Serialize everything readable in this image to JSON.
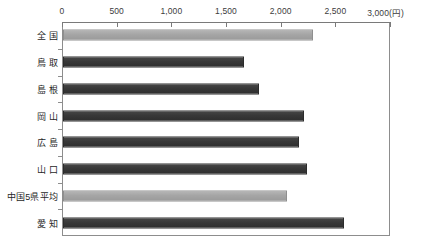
{
  "chart_data": {
    "type": "bar",
    "orientation": "horizontal",
    "title": "",
    "xlabel": "(円)",
    "ylabel": "",
    "unit": "円",
    "xlim": [
      0,
      3000
    ],
    "xticks": [
      0,
      500,
      1000,
      1500,
      2000,
      2500,
      3000
    ],
    "xticklabels": [
      "0",
      "500",
      "1,000",
      "1,500",
      "2,000",
      "2,500",
      "3,000"
    ],
    "axis_unit_label": "(円)",
    "grid": false,
    "legend": null,
    "categories": [
      "全 国",
      "鳥 取",
      "島 根",
      "岡 山",
      "広 島",
      "山 口",
      "中国5県平均",
      "愛 知"
    ],
    "values": [
      2290,
      1660,
      1790,
      2200,
      2160,
      2230,
      2050,
      2570
    ],
    "bar_styles": [
      "light",
      "dark",
      "dark",
      "dark",
      "dark",
      "dark",
      "light",
      "dark"
    ],
    "colors": {
      "light_bar": "#a5a5a5",
      "dark_bar": "#383838",
      "axis": "#7a7a7a",
      "frame": "#8d8d8d",
      "text": "#1f1f1f",
      "background": "#ffffff"
    },
    "rows": [
      {
        "label": "全 国",
        "value": 2290,
        "style": "light"
      },
      {
        "label": "鳥 取",
        "value": 1660,
        "style": "dark"
      },
      {
        "label": "島 根",
        "value": 1790,
        "style": "dark"
      },
      {
        "label": "岡 山",
        "value": 2200,
        "style": "dark"
      },
      {
        "label": "広 島",
        "value": 2160,
        "style": "dark"
      },
      {
        "label": "山 口",
        "value": 2230,
        "style": "dark"
      },
      {
        "label": "中国5県平均",
        "value": 2050,
        "style": "light"
      },
      {
        "label": "愛 知",
        "value": 2570,
        "style": "dark"
      }
    ]
  }
}
